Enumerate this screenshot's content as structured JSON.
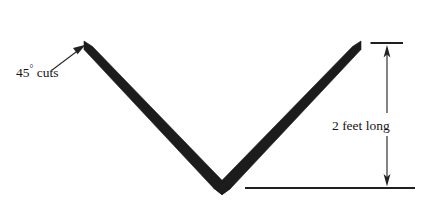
{
  "figure": {
    "background_color": "#ffffff",
    "stroke_color": "#1c1c1c",
    "line_color": "#2a2a2a"
  },
  "annotations": {
    "cuts_label": {
      "value": "45",
      "degree_symbol": "°",
      "suffix": " cuts",
      "full_text": "45° cuts",
      "icon": "leader-arrow-icon"
    },
    "length_label": {
      "full_text": "2 feet long",
      "measure": "2",
      "unit": "feet",
      "qualifier": "long",
      "icon": "double-headed-arrow-icon"
    }
  },
  "geometry": {
    "left_tip": {
      "x": 85,
      "y": 42
    },
    "vertex": {
      "x": 222,
      "y": 188
    },
    "right_tip": {
      "x": 360,
      "y": 42
    },
    "bar_thickness": 9,
    "dimension_line_x": 387,
    "dimension_top_y": 43,
    "dimension_bottom_y": 188
  }
}
